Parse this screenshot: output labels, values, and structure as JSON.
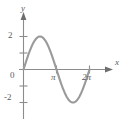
{
  "figure": {
    "name": "sine-curve-graph",
    "background_color": "#ffffff",
    "curve_color": "#9a9a9a",
    "axis_color": "#8c8c8c",
    "label_color": "#5a5a5a"
  },
  "labels": {
    "y_axis": "y",
    "x_axis": "x",
    "origin": "0",
    "y_tick_pos2": "2",
    "y_tick_neg2": "-2",
    "x_tick_pi": "π",
    "x_tick_2pi": "2π"
  },
  "chart_data": {
    "type": "line",
    "title": "",
    "subtitle": "",
    "xlabel": "x",
    "ylabel": "y",
    "function": "y = 2 sin(x)",
    "amplitude": 2,
    "period": "2π",
    "xlim": [
      0,
      7.3304
    ],
    "ylim": [
      -2.85,
      2.85
    ],
    "grid": false,
    "legend": null,
    "x_ticks": [
      {
        "value": 3.14159,
        "label": "π"
      },
      {
        "value": 6.28319,
        "label": "2π"
      }
    ],
    "y_ticks": [
      {
        "value": 2,
        "label": "2"
      },
      {
        "value": 1,
        "label": ""
      },
      {
        "value": 0,
        "label": "0"
      },
      {
        "value": -1,
        "label": ""
      },
      {
        "value": -2,
        "label": "-2"
      }
    ],
    "series": [
      {
        "name": "y = 2 sin(x)",
        "x": [
          0,
          0.3927,
          0.7854,
          1.1781,
          1.5708,
          1.9635,
          2.3562,
          2.7489,
          3.14159,
          3.5343,
          3.927,
          4.3197,
          4.7124,
          5.1051,
          5.4978,
          5.8905,
          6.28319
        ],
        "values": [
          0,
          0.765,
          1.414,
          1.848,
          2,
          1.848,
          1.414,
          0.765,
          0,
          -0.765,
          -1.414,
          -1.848,
          -2,
          -1.848,
          -1.414,
          -0.765,
          0
        ]
      }
    ],
    "annotations": [
      {
        "text": "peak",
        "x": 1.5708,
        "y": 2
      },
      {
        "text": "trough",
        "x": 4.7124,
        "y": -2
      }
    ]
  }
}
